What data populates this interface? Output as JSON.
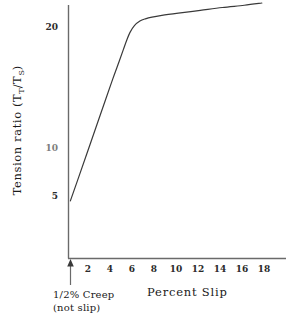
{
  "chart_data": {
    "type": "line",
    "title": "",
    "xlabel": "Percent Slip",
    "ylabel": "Tension ratio  (T_T/T_S)",
    "ylabel_parts": {
      "prefix": "Tension ratio  (T",
      "sub1": "T",
      "slash": "/T",
      "sub2": "S",
      "suffix": ")"
    },
    "xlim": [
      0,
      19.8
    ],
    "ylim": [
      0,
      22.6
    ],
    "grid": false,
    "legend": null,
    "xticks": [
      2,
      4,
      6,
      8,
      10,
      12,
      14,
      16,
      18
    ],
    "xtick_labels": [
      "2",
      "4",
      "6",
      "8",
      "10",
      "12",
      "14",
      "16",
      "18"
    ],
    "yticks": [
      5,
      10,
      20
    ],
    "ytick_labels": [
      "5",
      "10",
      "20"
    ],
    "ytick_faint": [
      "10"
    ],
    "series": [
      {
        "name": "Tension ratio vs percent slip",
        "x": [
          0.17,
          1.0,
          2.0,
          3.0,
          4.0,
          4.6,
          5.0,
          5.3,
          5.6,
          6.0,
          6.5,
          7.0,
          7.6,
          8.5,
          10.0,
          12.0,
          14.0,
          16.0,
          17.6
        ],
        "y": [
          5.1,
          7.4,
          10.2,
          13.0,
          15.8,
          17.4,
          18.5,
          19.3,
          20.0,
          20.6,
          21.0,
          21.2,
          21.35,
          21.5,
          21.7,
          21.95,
          22.2,
          22.4,
          22.6
        ]
      }
    ],
    "annotations": [
      {
        "name": "creep-marker",
        "line1": "1/2% Creep",
        "line2": "(not slip)",
        "arrow": "up-arrow",
        "x": 0.17
      }
    ]
  },
  "colors": {
    "background": "#ffffff",
    "axis": "#555555",
    "curve": "#3a3a3a",
    "text": "#1a1a1a",
    "faint_text": "#7d7d7d"
  }
}
